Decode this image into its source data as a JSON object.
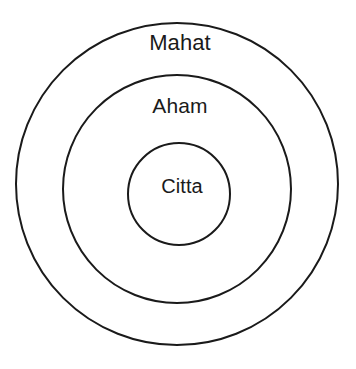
{
  "diagram": {
    "type": "concentric-circles",
    "title": "",
    "background_color": "#ffffff",
    "stroke_color": "#1a1a1a",
    "text_color": "#1a1a1a",
    "stroke_width_px": 2,
    "rings": [
      {
        "id": "outer",
        "label": "Mahat",
        "center_x": 177,
        "center_y": 184,
        "radius": 161,
        "label_x": 180,
        "label_y": 44,
        "font_size": 22
      },
      {
        "id": "middle",
        "label": "Aham",
        "center_x": 177,
        "center_y": 189,
        "radius": 114,
        "label_x": 180,
        "label_y": 107,
        "font_size": 21
      },
      {
        "id": "inner",
        "label": "Citta",
        "center_x": 179,
        "center_y": 194,
        "radius": 51,
        "label_x": 182,
        "label_y": 187,
        "font_size": 20
      }
    ]
  }
}
